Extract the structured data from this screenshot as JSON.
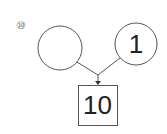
{
  "problem": {
    "number_label": "⑩",
    "left_circle": {
      "value": ""
    },
    "right_circle": {
      "value": "1"
    },
    "result_box": {
      "value": "10"
    }
  },
  "colors": {
    "stroke": "#555555",
    "text": "#222222",
    "background": "#ffffff"
  }
}
